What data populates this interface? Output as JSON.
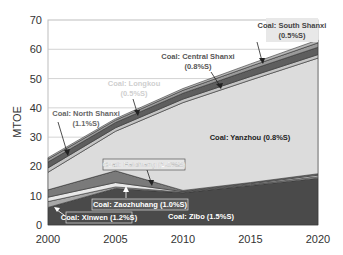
{
  "chart_data": {
    "type": "area",
    "stacked": true,
    "title": "",
    "xlabel": "",
    "ylabel": "MTOE",
    "xlim": [
      2000,
      2020
    ],
    "ylim": [
      0,
      70
    ],
    "x": [
      2000,
      2005,
      2010,
      2015,
      2020
    ],
    "x_ticks": [
      "2000",
      "2005",
      "2010",
      "2015",
      "2020"
    ],
    "y_ticks": [
      "0",
      "10",
      "20",
      "30",
      "40",
      "50",
      "60",
      "70"
    ],
    "grid": "horizontal",
    "series": [
      {
        "name": "Coal: Zibo (1.5%S)",
        "values": [
          6,
          12.5,
          11,
          13.5,
          16
        ],
        "color": "#4a4a4a"
      },
      {
        "name": "Coal: Xinwen (1.2%S)",
        "values": [
          2,
          0.5,
          0.2,
          0.3,
          0.5
        ],
        "color": "#a8a8a8"
      },
      {
        "name": "Coal: Zaozhuhang (1.0%S)",
        "values": [
          1.5,
          1.5,
          0.2,
          0.3,
          0.5
        ],
        "color": "#e8e8e8"
      },
      {
        "name": "Coal: Feicheng (1.0%S)",
        "values": [
          2.5,
          4,
          0.4,
          0.4,
          0.5
        ],
        "color": "#7a7a7a"
      },
      {
        "name": "Coal: Yanzhou (0.8%S)",
        "values": [
          6,
          13.5,
          30,
          35,
          39.5
        ],
        "color": "#dcdcdc"
      },
      {
        "name": "Coal: Longkou (0.5%S)",
        "values": [
          1.5,
          1.2,
          1.2,
          1.2,
          1.2
        ],
        "color": "#c4c4c4"
      },
      {
        "name": "Coal: North Shanxi (1.1%S)",
        "values": [
          2,
          1.8,
          2,
          2.3,
          2.5
        ],
        "color": "#5e5e5e"
      },
      {
        "name": "Coal: Central Shanxi (0.8%S)",
        "values": [
          1,
          0.8,
          1,
          1.2,
          1.5
        ],
        "color": "#9a9a9a"
      },
      {
        "name": "Coal: South Shanxi (0.5%S)",
        "values": [
          0.5,
          0.5,
          0.6,
          0.8,
          1
        ],
        "color": "#b8b8b8"
      }
    ],
    "annotations": [
      {
        "text": "Coal: South Shanxi",
        "text2": "(0.5%S)"
      },
      {
        "text": "Coal: Central Shanxi",
        "text2": "(0.8%S)"
      },
      {
        "text": "Coal: Longkou",
        "text2": "(0.5%S)"
      },
      {
        "text": "Coal: North Shanxi",
        "text2": "(1.1%S)"
      },
      {
        "text": "Coal: Yanzhou (0.8%S)"
      },
      {
        "text": "Coal: Feicheng (1.0%S)"
      },
      {
        "text": "Coal: Zaozhuhang (1.0%S)"
      },
      {
        "text": "Coal: Xinwen (1.2%S)"
      },
      {
        "text": "Coal: Zibo (1.5%S)"
      }
    ]
  }
}
